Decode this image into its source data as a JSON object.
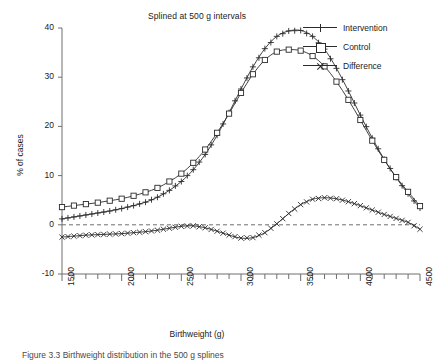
{
  "chart_data": {
    "type": "line",
    "title": "Splined at 500 g intervals",
    "xlabel": "Birthweight (g)",
    "ylabel": "% of cases",
    "xlim": [
      1500,
      4500
    ],
    "ylim": [
      -10,
      40
    ],
    "xticks": [
      1500,
      2000,
      2500,
      3000,
      3500,
      4000,
      4500
    ],
    "yticks": [
      -10,
      0,
      10,
      20,
      30,
      40
    ],
    "grid": false,
    "legend_position": "top-right-outside",
    "zero_reference_line": true,
    "x": [
      1500,
      1600,
      1700,
      1800,
      1900,
      2000,
      2100,
      2200,
      2300,
      2400,
      2500,
      2600,
      2700,
      2800,
      2900,
      3000,
      3100,
      3200,
      3300,
      3400,
      3500,
      3600,
      3700,
      3800,
      3900,
      4000,
      4100,
      4200,
      4300,
      4400,
      4500
    ],
    "series": [
      {
        "name": "Intervention",
        "marker": "plus",
        "values": [
          1.2,
          1.6,
          2.0,
          2.4,
          2.8,
          3.3,
          3.9,
          4.6,
          5.6,
          7.0,
          8.8,
          11.2,
          14.3,
          18.2,
          22.8,
          27.6,
          32.1,
          35.8,
          38.3,
          39.4,
          39.5,
          38.3,
          35.7,
          31.8,
          27.2,
          22.3,
          17.6,
          13.3,
          9.6,
          6.3,
          3.4
        ]
      },
      {
        "name": "Control",
        "marker": "square",
        "values": [
          3.6,
          3.9,
          4.2,
          4.5,
          4.9,
          5.3,
          5.9,
          6.6,
          7.5,
          8.8,
          10.4,
          12.6,
          15.3,
          18.7,
          22.6,
          26.8,
          30.6,
          33.5,
          35.2,
          35.6,
          35.4,
          34.3,
          32.2,
          29.1,
          25.4,
          21.3,
          17.1,
          13.2,
          9.7,
          6.7,
          3.8
        ]
      },
      {
        "name": "Difference",
        "marker": "cross",
        "values": [
          -2.5,
          -2.3,
          -2.1,
          -2.0,
          -1.9,
          -1.8,
          -1.6,
          -1.4,
          -1.1,
          -0.7,
          -0.3,
          -0.2,
          -0.6,
          -1.3,
          -2.1,
          -2.7,
          -2.6,
          -1.6,
          0.2,
          2.3,
          4.1,
          5.2,
          5.5,
          5.3,
          4.7,
          3.9,
          3.0,
          2.1,
          1.3,
          0.5,
          -0.9
        ]
      }
    ]
  },
  "legend": {
    "items": [
      {
        "label": "Intervention"
      },
      {
        "label": "Control"
      },
      {
        "label": "Difference"
      }
    ]
  },
  "caption": {
    "text": "Figure 3.3   Birthweight distribution in the 500 g splines"
  },
  "colors": {
    "line": "#2b2b2b",
    "axis": "#6e6e6e",
    "zero_line": "#6e6e6e",
    "background": "#ffffff"
  }
}
